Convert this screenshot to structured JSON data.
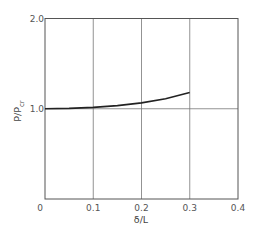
{
  "chart_data": {
    "type": "line",
    "title": "",
    "xlabel": "δ/L",
    "ylabel": "P/Pcr",
    "ylabel_main": "P/P",
    "ylabel_sub": "cr",
    "xlim": [
      0,
      0.4
    ],
    "ylim": [
      0,
      2.0
    ],
    "grid": true,
    "x_ticks": [
      "0",
      "0.1",
      "0.2",
      "0.3",
      "0.4"
    ],
    "y_ticks": [
      "1.0",
      "2.0"
    ],
    "series": [
      {
        "name": "P/Pcr vs δ/L",
        "x": [
          0,
          0.05,
          0.1,
          0.15,
          0.2,
          0.25,
          0.3
        ],
        "y": [
          1.0,
          1.004,
          1.015,
          1.035,
          1.065,
          1.11,
          1.18
        ]
      }
    ]
  }
}
